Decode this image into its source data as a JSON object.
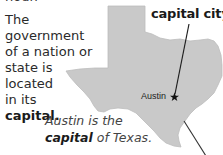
{
  "header": {
    "cut_off_label": "noun"
  },
  "definition": {
    "lines": [
      "The government",
      "of a nation or",
      "state is",
      "located",
      "in its"
    ],
    "keyword": "capital",
    "keyword_suffix": "."
  },
  "map": {
    "region": "Texas",
    "fill_color": "#c9c9c9",
    "pointer_label": "capital city",
    "city_label": "Austin",
    "city_marker": "star-icon"
  },
  "caption": {
    "line1": "Austin is the",
    "keyword": "capital",
    "line2_rest": " of Texas."
  }
}
